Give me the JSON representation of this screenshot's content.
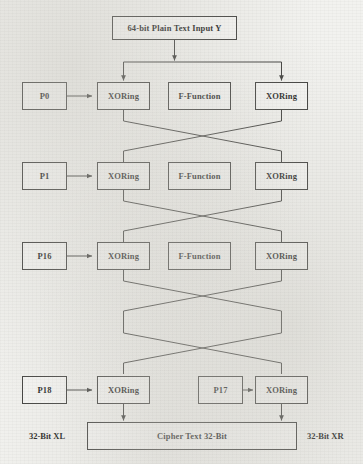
{
  "diagram": {
    "background_color": "#f2f2ef",
    "line_color": "#3a3a38",
    "text_color": "#1b1b1a",
    "input_box": {
      "label": "64-bit Plain Text Input Y"
    },
    "rounds": [
      {
        "subkey_label": "P0",
        "xor_left_label": "XORing",
        "function_label": "F-Function",
        "xor_right_label": "XORing"
      },
      {
        "subkey_label": "P1",
        "xor_left_label": "XORing",
        "function_label": "F-Function",
        "xor_right_label": "XORing"
      },
      {
        "subkey_label": "P16",
        "xor_left_label": "XORing",
        "function_label": "F-Function",
        "xor_right_label": "XORing"
      }
    ],
    "final_round": {
      "left_subkey_label": "P18",
      "left_xor_label": "XORing",
      "right_subkey_label": "P17",
      "right_xor_label": "XORing"
    },
    "output_box": {
      "label": "Cipher Text 32-Bit"
    },
    "side_labels": {
      "left": "32-Bit XL",
      "right": "32-Bit XR"
    }
  }
}
